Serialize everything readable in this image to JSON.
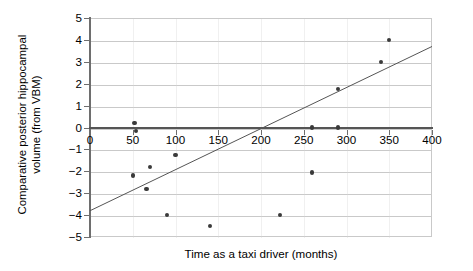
{
  "chart_data": {
    "type": "scatter",
    "title": "",
    "xlabel": "Time as a taxi driver (months)",
    "ylabel": "Comparative posterior hippocampal volume (from VBM)",
    "ylabel_lines": [
      "Comparative posterior hippocampal",
      "volume (from VBM)"
    ],
    "xlim": [
      0,
      400
    ],
    "ylim": [
      -5,
      5
    ],
    "xticks": [
      0,
      50,
      100,
      150,
      200,
      250,
      300,
      350,
      400
    ],
    "xtick_labels": [
      "0",
      "50",
      "100",
      "150",
      "200",
      "250",
      "300",
      "350",
      "400"
    ],
    "yticks": [
      5,
      4,
      3,
      2,
      1,
      0,
      -1,
      -2,
      -3,
      -4,
      -5
    ],
    "ytick_labels": [
      "5",
      "4",
      "3",
      "2",
      "1",
      "0",
      "−1",
      "−2",
      "−3",
      "−4",
      "−5"
    ],
    "grid": "horizontal",
    "legend": "none",
    "point_color": "#3a3a3a",
    "line_color": "#555555",
    "grid_color": "#c9c9c9",
    "axis_color": "#6e6e6e",
    "points": [
      {
        "x": 52,
        "y": 0.2
      },
      {
        "x": 54,
        "y": -0.15
      },
      {
        "x": 50,
        "y": -2.2
      },
      {
        "x": 66,
        "y": -2.8
      },
      {
        "x": 70,
        "y": -1.8
      },
      {
        "x": 90,
        "y": -4.0
      },
      {
        "x": 100,
        "y": -1.25
      },
      {
        "x": 140,
        "y": -4.5
      },
      {
        "x": 222,
        "y": -4.0
      },
      {
        "x": 260,
        "y": -2.05
      },
      {
        "x": 260,
        "y": 0.0
      },
      {
        "x": 290,
        "y": 0.0
      },
      {
        "x": 290,
        "y": 1.75
      },
      {
        "x": 340,
        "y": 3.0
      },
      {
        "x": 350,
        "y": 4.0
      }
    ],
    "trendline": {
      "x0": 0,
      "y0": -3.8,
      "x1": 400,
      "y1": 3.7
    }
  }
}
